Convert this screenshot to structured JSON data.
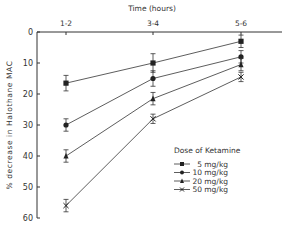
{
  "chart_data": {
    "type": "line",
    "title": "",
    "xlabel": "Time (hours)",
    "ylabel": "% decrease in Halothane MAC",
    "categories": [
      "1-2",
      "3-4",
      "5-6"
    ],
    "ylim": [
      0,
      60
    ],
    "y_inverted": true,
    "y_ticks": [
      0,
      10,
      20,
      30,
      40,
      50,
      60
    ],
    "grid": false,
    "x_axis_position": "top",
    "legend": {
      "title": "Dose of Ketamine",
      "position": "lower right"
    },
    "series": [
      {
        "name": "5 mg/kg",
        "marker": "square",
        "values": [
          16.5,
          10,
          3
        ],
        "errors": [
          2.5,
          3,
          2
        ]
      },
      {
        "name": "10 mg/kg",
        "marker": "circle",
        "values": [
          30,
          15,
          8
        ],
        "errors": [
          2,
          2.5,
          2
        ]
      },
      {
        "name": "20 mg/kg",
        "marker": "triangle",
        "values": [
          40,
          21.5,
          10.5
        ],
        "errors": [
          2,
          2,
          2
        ]
      },
      {
        "name": "50 mg/kg",
        "marker": "x",
        "values": [
          56,
          28,
          14.5
        ],
        "errors": [
          2,
          1.5,
          1.5
        ]
      }
    ]
  },
  "labels": {
    "xlabel": "Time (hours)",
    "ylabel": "% decrease in Halothane MAC",
    "legend_title": "Dose of Ketamine",
    "x_ticks": [
      "1-2",
      "3-4",
      "5-6"
    ],
    "y_ticks": [
      "0",
      "10",
      "20",
      "30",
      "40",
      "50",
      "60"
    ],
    "legend": [
      "5 mg/kg",
      "10 mg/kg",
      "20 mg/kg",
      "50 mg/kg"
    ]
  }
}
